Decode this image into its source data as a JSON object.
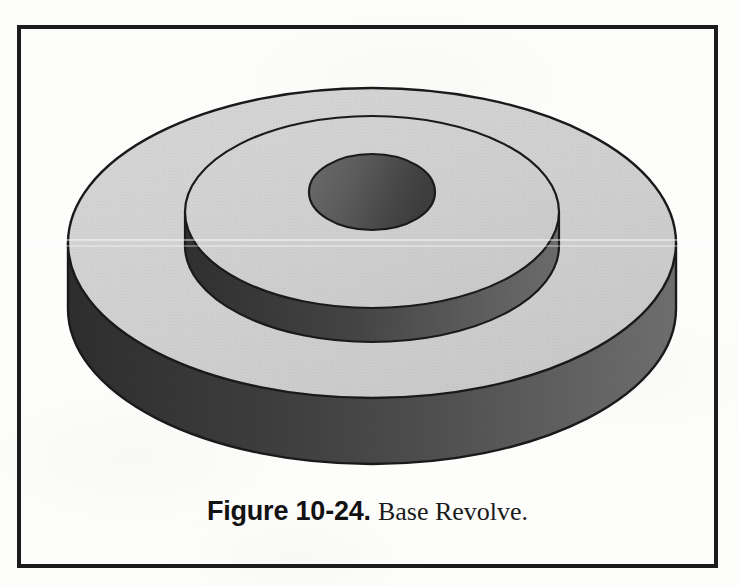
{
  "page": {
    "background_color": "#fdfdfc",
    "width": 738,
    "height": 586
  },
  "figure": {
    "frame": {
      "border_color": "#1c1c1c",
      "border_width_px": 4,
      "x": 17,
      "y": 25,
      "width": 701,
      "height": 543
    },
    "caption": {
      "label": "Figure 10-24.",
      "title": "Base Revolve.",
      "full_text": "Figure 10-24. Base Revolve."
    },
    "illustration": {
      "description": "Shaded 3D solid model of a stepped cylindrical boss (base revolve): a large lower disc with a smaller concentric disc stacked on top and a circular through-hole at the centre.",
      "colors": {
        "top_face_light": "#d2d2d2",
        "top_face_light_2": "#cfcfcf",
        "wall_dark_left": "#333333",
        "wall_mid": "#4b4b4b",
        "wall_light_right": "#6c6c6c",
        "hole_dark": "#5d5d5d",
        "hole_dark_2": "#3f3f3f",
        "outline": "#1a1a1a"
      },
      "parts": [
        {
          "name": "lower-disc",
          "shape": "cylinder",
          "top_center": [
            372,
            243
          ],
          "top_rx": 304,
          "top_ry": 155,
          "height_px": 66
        },
        {
          "name": "upper-disc",
          "shape": "cylinder",
          "top_center": [
            372,
            212
          ],
          "top_rx": 187,
          "top_ry": 96,
          "height_px": 34
        },
        {
          "name": "center-hole",
          "shape": "circular-bore",
          "top_center": [
            372,
            192
          ],
          "top_rx": 63,
          "top_ry": 38
        }
      ]
    }
  }
}
